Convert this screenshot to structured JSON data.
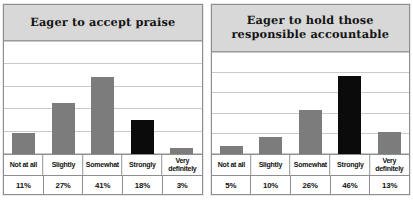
{
  "page": {
    "background": "#ffffff",
    "bar_color": "#7c7c7c",
    "accent_bar_color": "#0b0b0b",
    "title_band_color": "#d8d8d8",
    "border_color": "#8e8e8e",
    "gridline_color": "#c9c9c9"
  },
  "chart_data": [
    {
      "type": "bar",
      "title": "Eager to accept praise",
      "categories": [
        "Not at all",
        "Slightly",
        "Somewhat",
        "Strongly",
        "Very definitely"
      ],
      "values": [
        11,
        27,
        41,
        18,
        3
      ],
      "value_labels": [
        "11%",
        "27%",
        "41%",
        "18%",
        "3%"
      ],
      "highlight_index": 3,
      "highlight_color": "#0b0b0b",
      "bar_color": "#7c7c7c",
      "xlabel": "",
      "ylabel": "",
      "ylim": [
        0,
        60
      ],
      "grid": true,
      "gridline_count": 6,
      "legend": "none"
    },
    {
      "type": "bar",
      "title": "Eager to hold those responsible accountable",
      "title_lines": [
        "Eager to hold those",
        "responsible accountable"
      ],
      "categories": [
        "Not at all",
        "Slightly",
        "Somewhat",
        "Strongly",
        "Very definitely"
      ],
      "values": [
        5,
        10,
        26,
        46,
        13
      ],
      "value_labels": [
        "5%",
        "10%",
        "26%",
        "46%",
        "13%"
      ],
      "highlight_index": 3,
      "highlight_color": "#0b0b0b",
      "bar_color": "#7c7c7c",
      "xlabel": "",
      "ylabel": "",
      "ylim": [
        0,
        60
      ],
      "grid": true,
      "gridline_count": 6,
      "legend": "none"
    }
  ],
  "charts": [
    {
      "title": "Eager to accept praise",
      "title_line1": "Eager to accept praise",
      "title_line2": "",
      "cat0": "Not at all",
      "cat1": "Slightly",
      "cat2": "Somewhat",
      "cat3": "Strongly",
      "cat4": "Very\ndefinitely",
      "val0": "11%",
      "val1": "27%",
      "val2": "41%",
      "val3": "18%",
      "val4": "3%"
    },
    {
      "title": "Eager to hold those responsible accountable",
      "title_line1": "Eager to hold those",
      "title_line2": "responsible accountable",
      "cat0": "Not at all",
      "cat1": "Slightly",
      "cat2": "Somewhat",
      "cat3": "Strongly",
      "cat4": "Very\ndefinitely",
      "val0": "5%",
      "val1": "10%",
      "val2": "26%",
      "val3": "46%",
      "val4": "13%"
    }
  ]
}
